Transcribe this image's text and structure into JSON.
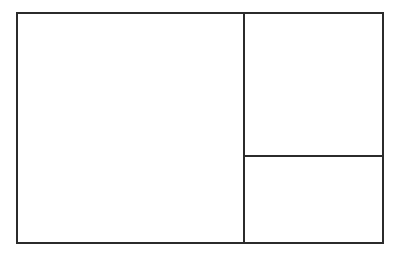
{
  "figure": {
    "name": "rectangle-subdivision-diagram",
    "background_color": "#ffffff",
    "line_color": "#2b2b2b",
    "line_width_px": 2,
    "canvas": {
      "width": 401,
      "height": 255
    },
    "outer_rectangle": {
      "label": "outer-rectangle",
      "x": 16,
      "y": 12,
      "width": 368,
      "height": 232,
      "fill": "#ffffff",
      "stroke": "#2b2b2b",
      "stroke_width": 2
    },
    "partitions": [
      {
        "label": "vertical-divider",
        "orientation": "vertical",
        "x": 244,
        "y_start": 12,
        "y_end": 244,
        "length": 232,
        "stroke": "#2b2b2b",
        "stroke_width": 2
      },
      {
        "label": "horizontal-divider",
        "orientation": "horizontal",
        "y": 156,
        "x_start": 244,
        "x_end": 384,
        "length": 140,
        "stroke": "#2b2b2b",
        "stroke_width": 2
      }
    ],
    "regions": [
      {
        "label": "left-region",
        "position": "left",
        "x": 16,
        "y": 12,
        "width": 228,
        "height": 232,
        "fill": "#ffffff"
      },
      {
        "label": "top-right-region",
        "position": "top-right",
        "x": 244,
        "y": 12,
        "width": 140,
        "height": 144,
        "fill": "#ffffff"
      },
      {
        "label": "bottom-right-region",
        "position": "bottom-right",
        "x": 244,
        "y": 156,
        "width": 140,
        "height": 88,
        "fill": "#ffffff"
      }
    ]
  }
}
